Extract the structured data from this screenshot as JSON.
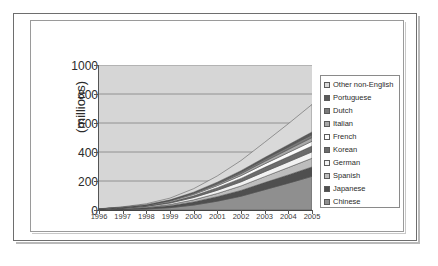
{
  "chart_data": {
    "type": "area",
    "stacked": true,
    "title": "",
    "subtitle": "",
    "xlabel": "",
    "ylabel": "(millions)",
    "categories": [
      "1996",
      "1997",
      "1998",
      "1999",
      "2000",
      "2001",
      "2002",
      "2003",
      "2004",
      "2005"
    ],
    "xticklabels": [
      "1996",
      "1997",
      "1998",
      "1999",
      "2000",
      "2001",
      "2002",
      "2003",
      "2004",
      "2005"
    ],
    "yticklabels": [
      "0",
      "200",
      "400",
      "600",
      "800",
      "1000"
    ],
    "ylim": [
      0,
      1000
    ],
    "ytickstep": 200,
    "grid": "horizontal",
    "legend_position": "right",
    "series": [
      {
        "name": "Chinese",
        "color": "#8f8f8f",
        "values": [
          1,
          3,
          7,
          16,
          34,
          61,
          95,
          140,
          185,
          232
        ]
      },
      {
        "name": "Japanese",
        "color": "#4f4f4f",
        "values": [
          2,
          4,
          8,
          14,
          22,
          31,
          40,
          49,
          57,
          65
        ]
      },
      {
        "name": "Spanish",
        "color": "#bdbdbd",
        "values": [
          1,
          2,
          4,
          8,
          14,
          22,
          31,
          41,
          51,
          60
        ]
      },
      {
        "name": "German",
        "color": "#f2f2f2",
        "values": [
          1,
          3,
          6,
          10,
          16,
          22,
          28,
          34,
          39,
          44
        ]
      },
      {
        "name": "Korean",
        "color": "#6b6b6b",
        "values": [
          1,
          2,
          4,
          7,
          12,
          18,
          24,
          30,
          35,
          40
        ]
      },
      {
        "name": "French",
        "color": "#fbfbfb",
        "values": [
          1,
          2,
          3,
          6,
          9,
          14,
          19,
          24,
          29,
          33
        ]
      },
      {
        "name": "Italian",
        "color": "#a8a8a8",
        "values": [
          0,
          1,
          2,
          4,
          7,
          10,
          14,
          18,
          22,
          26
        ]
      },
      {
        "name": "Dutch",
        "color": "#7a7a7a",
        "values": [
          0,
          1,
          2,
          3,
          5,
          8,
          11,
          14,
          17,
          20
        ]
      },
      {
        "name": "Portuguese",
        "color": "#5a5a5a",
        "values": [
          0,
          1,
          1,
          2,
          4,
          6,
          9,
          12,
          15,
          18
        ]
      },
      {
        "name": "Other non-English",
        "color": "#d9d9d9",
        "values": [
          1,
          3,
          6,
          12,
          24,
          43,
          70,
          105,
          145,
          190
        ]
      }
    ],
    "totals": [
      8,
      22,
      43,
      82,
      147,
      235,
      341,
      467,
      595,
      728
    ],
    "plot_background": "#d6d6d6",
    "gridline_color": "#8a8a8a"
  },
  "legend": {
    "items": [
      {
        "label": "Other non-English",
        "swatch": "#d9d9d9"
      },
      {
        "label": "Portuguese",
        "swatch": "#5a5a5a"
      },
      {
        "label": "Dutch",
        "swatch": "#7a7a7a"
      },
      {
        "label": "Italian",
        "swatch": "#a8a8a8"
      },
      {
        "label": "French",
        "swatch": "#fbfbfb"
      },
      {
        "label": "Korean",
        "swatch": "#6b6b6b"
      },
      {
        "label": "German",
        "swatch": "#f2f2f2"
      },
      {
        "label": "Spanish",
        "swatch": "#bdbdbd"
      },
      {
        "label": "Japanese",
        "swatch": "#4f4f4f"
      },
      {
        "label": "Chinese",
        "swatch": "#8f8f8f"
      }
    ]
  }
}
